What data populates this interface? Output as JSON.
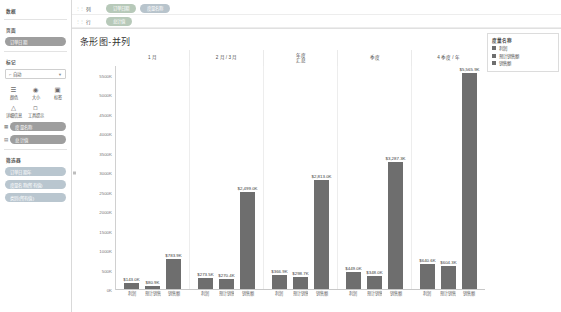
{
  "sidebar": {
    "data_section_title": "数据",
    "pages_section_title": "页面",
    "pages_pill": "订单日期",
    "marks_title": "标记",
    "marks_dropdown": "⌐ 自动",
    "mark_types": [
      {
        "icon": "bars-icon",
        "label": "颜色"
      },
      {
        "icon": "size-icon",
        "label": "大小"
      },
      {
        "icon": "label-icon",
        "label": "标签"
      },
      {
        "icon": "detail-icon",
        "label": "详细信息"
      },
      {
        "icon": "tooltip-icon",
        "label": "工具提示"
      }
    ],
    "mark_rows": [
      {
        "glyph": "☷",
        "label": "度量名称"
      },
      {
        "glyph": "☰",
        "label": "总计值"
      }
    ],
    "filters_title": "筛选器",
    "filters": [
      "订单日期年",
      "度量名称(所有值)",
      "类别(所有值)"
    ]
  },
  "shelves": {
    "columns_label": "列",
    "rows_label": "行",
    "columns_pills": [
      "订单日期",
      "度量名称"
    ],
    "rows_pills": [
      "总计值"
    ]
  },
  "chart_title": "条形图-并列",
  "legend": {
    "title": "度量名称",
    "items": [
      "利润",
      "预计销售额",
      "销售额"
    ]
  },
  "chart_data": {
    "type": "bar",
    "title": "条形图-并列",
    "xlabel": "订单日期 / 度量名称",
    "ylabel": "总计值",
    "ylim": [
      0,
      5750
    ],
    "y_unit": "K",
    "yticks": [
      "5500K",
      "5000K",
      "4500K",
      "4000K",
      "3500K",
      "3000K",
      "2500K",
      "2000K",
      "1500K",
      "1000K",
      "500K",
      "0K"
    ],
    "ytick_values": [
      5500,
      5000,
      4500,
      4000,
      3500,
      3000,
      2500,
      2000,
      1500,
      1000,
      500,
      0
    ],
    "categories": [
      "1 月",
      "2 月 / 3 月",
      "年度\n汇总",
      "季度",
      "4 季度 / 年"
    ],
    "series": [
      "利润",
      "预计销售额",
      "销售额"
    ],
    "grid": false,
    "legend_position": "right",
    "groups": [
      {
        "category": "1 月",
        "bars": [
          {
            "series": "利润",
            "label": "$143.0K",
            "value": 143.0
          },
          {
            "series": "预计销售额",
            "label": "$80.9K",
            "value": 80.9
          },
          {
            "series": "销售额",
            "label": "$783.9K",
            "value": 783.9
          }
        ]
      },
      {
        "category": "2 月 / 3 月",
        "bars": [
          {
            "series": "利润",
            "label": "$273.5K",
            "value": 273.5
          },
          {
            "series": "预计销售额",
            "label": "$270.4K",
            "value": 270.4
          },
          {
            "series": "销售额",
            "label": "$2,499.0K",
            "value": 2499.0
          }
        ]
      },
      {
        "category": "年度汇总",
        "bars": [
          {
            "series": "利润",
            "label": "$366.9K",
            "value": 366.9
          },
          {
            "series": "预计销售额",
            "label": "$298.7K",
            "value": 298.7
          },
          {
            "series": "销售额",
            "label": "$2,813.0K",
            "value": 2813.0
          }
        ]
      },
      {
        "category": "季度",
        "bars": [
          {
            "series": "利润",
            "label": "$449.0K",
            "value": 449.0
          },
          {
            "series": "预计销售额",
            "label": "$348.0K",
            "value": 348.0
          },
          {
            "series": "销售额",
            "label": "$3,287.3K",
            "value": 3287.3
          }
        ]
      },
      {
        "category": "4 季度 / 年",
        "bars": [
          {
            "series": "利润",
            "label": "$640.6K",
            "value": 640.6
          },
          {
            "series": "预计销售额",
            "label": "$604.3K",
            "value": 604.3
          },
          {
            "series": "销售额",
            "label": "$5,565.9K",
            "value": 5565.9
          }
        ]
      }
    ],
    "x_tick_labels": [
      "利润",
      "预计销售额",
      "销售额"
    ],
    "bar_color": "#6e6e6e"
  }
}
